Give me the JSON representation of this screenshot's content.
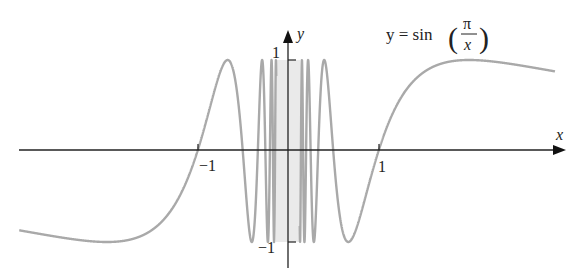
{
  "chart_data": {
    "type": "line",
    "function": "sin(pi/x)",
    "xlabel": "x",
    "ylabel": "y",
    "xlim": [
      -2.97,
      3.05
    ],
    "ylim": [
      -1.3,
      1.35
    ],
    "x_ticks": [
      {
        "value": -1,
        "label": "−1"
      },
      {
        "value": 1,
        "label": "1"
      }
    ],
    "y_ticks": [
      {
        "value": 1,
        "label": "1"
      },
      {
        "value": -1,
        "label": "−1"
      }
    ],
    "grid": false,
    "legend": null,
    "annotation": {
      "text_prefix": "y = sin",
      "numerator": "π",
      "denominator": "x"
    },
    "curve_color": "#a9a9a9",
    "axis_color": "#222222",
    "sample_points": [
      {
        "x": -2.97,
        "y": -0.87
      },
      {
        "x": -2.0,
        "y": -1.0
      },
      {
        "x": -1.0,
        "y": 0.0
      },
      {
        "x": -0.667,
        "y": 1.0
      },
      {
        "x": -0.5,
        "y": 0.0
      },
      {
        "x": -0.4,
        "y": -1.0
      },
      {
        "x": 0.4,
        "y": 1.0
      },
      {
        "x": 0.5,
        "y": 0.0
      },
      {
        "x": 0.667,
        "y": -1.0
      },
      {
        "x": 1.0,
        "y": 0.0
      },
      {
        "x": 2.0,
        "y": 1.0
      },
      {
        "x": 2.95,
        "y": 0.88
      }
    ]
  },
  "labels": {
    "x_axis": "x",
    "y_axis": "y",
    "tick_x_neg1": "−1",
    "tick_x_pos1": "1",
    "tick_y_pos1": "1",
    "tick_y_neg1": "−1",
    "equation_prefix": "y = sin",
    "equation_num": "π",
    "equation_den": "x"
  }
}
